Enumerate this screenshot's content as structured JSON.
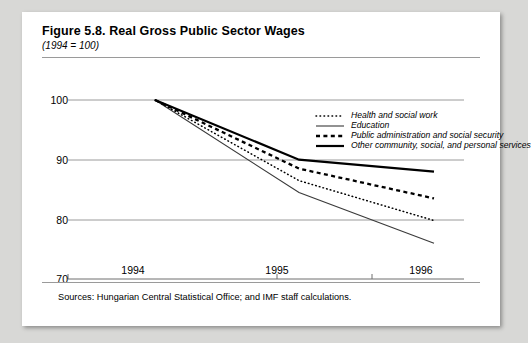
{
  "figure": {
    "title": "Figure 5.8. Real Gross Public Sector Wages",
    "subtitle": "(1994 = 100)",
    "sources": "Sources:  Hungarian Central Statistical Office; and IMF staff calculations."
  },
  "colors": {
    "page_background": "#d8d8d6",
    "card_background": "#ffffff",
    "ink": "#000000",
    "gridline": "#9a9a9a",
    "axis": "#6e6e6e"
  },
  "chart_data": {
    "type": "line",
    "title": "Figure 5.8. Real Gross Public Sector Wages",
    "subtitle": "(1994 = 100)",
    "xlabel": "",
    "ylabel": "",
    "x": [
      "1994",
      "1995",
      "1996"
    ],
    "categories": [
      "1994",
      "1995",
      "1996"
    ],
    "ylim": [
      70,
      100
    ],
    "yticks": [
      70,
      80,
      90,
      100
    ],
    "ytick_labels": [
      "70",
      "80",
      "90",
      "100"
    ],
    "xtick_labels": [
      "1994",
      "1995",
      "1996"
    ],
    "grid": true,
    "grid_axis": "y",
    "legend_position": "inside-top-right",
    "series": [
      {
        "name": "Health and social work",
        "style": "fine-dotted",
        "values": [
          100,
          86.5,
          79.8
        ]
      },
      {
        "name": "Education",
        "style": "thin-solid",
        "values": [
          100,
          84.5,
          76.0
        ]
      },
      {
        "name": "Public administration and social security",
        "style": "bold-dashed",
        "values": [
          100,
          88.5,
          83.5
        ]
      },
      {
        "name": "Other community, social, and personal services",
        "style": "thick-solid",
        "values": [
          100,
          90.0,
          88.0
        ]
      }
    ]
  }
}
